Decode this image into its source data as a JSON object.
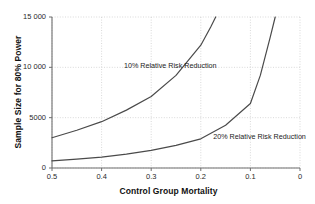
{
  "chart_data": {
    "type": "line",
    "title": "",
    "xlabel": "Control Group Mortality",
    "ylabel": "Sample Size for 80% Power",
    "xlim": [
      0.5,
      0.0
    ],
    "ylim": [
      0,
      15000
    ],
    "x_reversed": true,
    "xticks": [
      "0.5",
      "0.4",
      "0.3",
      "0.2",
      "0.1",
      "0"
    ],
    "xtick_values": [
      0.5,
      0.4,
      0.3,
      0.2,
      0.1,
      0.0
    ],
    "yticks": [
      "0",
      "5000",
      "10 000",
      "15 000"
    ],
    "ytick_values": [
      0,
      5000,
      10000,
      15000
    ],
    "grid": true,
    "grid_style": "dotted",
    "legend": "inline-annotations",
    "series": [
      {
        "name": "10% Relative Risk Reduction",
        "label": "10% Relative Risk Reduction",
        "color": "#4a4a4a",
        "x": [
          0.5,
          0.45,
          0.4,
          0.35,
          0.3,
          0.25,
          0.2,
          0.18,
          0.17
        ],
        "values": [
          3000,
          3750,
          4600,
          5750,
          7100,
          9200,
          12200,
          14000,
          15000
        ]
      },
      {
        "name": "20% Relative Risk Reduction",
        "label": "20% Relative Risk Reduction",
        "color": "#4a4a4a",
        "x": [
          0.5,
          0.45,
          0.4,
          0.35,
          0.3,
          0.25,
          0.2,
          0.15,
          0.1,
          0.08,
          0.06,
          0.05
        ],
        "values": [
          700,
          880,
          1080,
          1380,
          1750,
          2250,
          2900,
          4250,
          6400,
          9200,
          13000,
          15000
        ]
      }
    ],
    "annotations": [
      {
        "text": "10% Relative Risk Reduction",
        "x": 0.355,
        "y": 10150
      },
      {
        "text": "20% Relative Risk Reduction",
        "x": 0.175,
        "y": 3050
      }
    ]
  },
  "colors": {
    "background": "#ffffff",
    "axis": "#6e6e6e",
    "grid": "#c9c9c9",
    "curve": "#4a4a4a",
    "text": "#1a1a1a"
  }
}
